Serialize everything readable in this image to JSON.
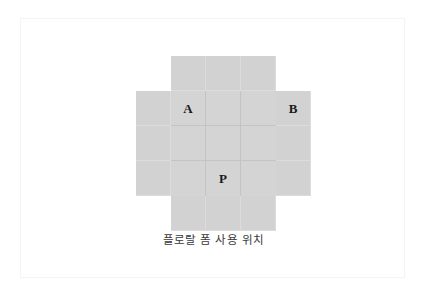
{
  "figure": {
    "caption": "플로랄 폼 사용 위치",
    "colors": {
      "cell_fill": "#d4d4d4",
      "wing_fill": "#d2d2d2",
      "grid_line": "#c4c4c4",
      "wing_grid_line": "#dcdcdc",
      "label_text": "#1a1a1a",
      "frame_border": "#f4f4f4",
      "background": "#ffffff"
    },
    "shape": "cross",
    "center_grid": {
      "rows": 3,
      "columns": 3,
      "cells": [
        [
          {
            "label": "A"
          },
          {
            "label": ""
          },
          {
            "label": ""
          }
        ],
        [
          {
            "label": ""
          },
          {
            "label": ""
          },
          {
            "label": ""
          }
        ],
        [
          {
            "label": ""
          },
          {
            "label": "P"
          },
          {
            "label": ""
          }
        ]
      ]
    },
    "wing_top": {
      "rows": 1,
      "columns": 3,
      "cells": [
        {
          "label": ""
        },
        {
          "label": ""
        },
        {
          "label": ""
        }
      ]
    },
    "wing_bottom": {
      "rows": 1,
      "columns": 3,
      "cells": [
        {
          "label": ""
        },
        {
          "label": ""
        },
        {
          "label": ""
        }
      ]
    },
    "wing_left": {
      "rows": 3,
      "columns": 1,
      "cells": [
        {
          "label": ""
        },
        {
          "label": ""
        },
        {
          "label": ""
        }
      ]
    },
    "wing_right": {
      "rows": 3,
      "columns": 1,
      "cells": [
        {
          "label": "B"
        },
        {
          "label": ""
        },
        {
          "label": ""
        }
      ]
    }
  }
}
